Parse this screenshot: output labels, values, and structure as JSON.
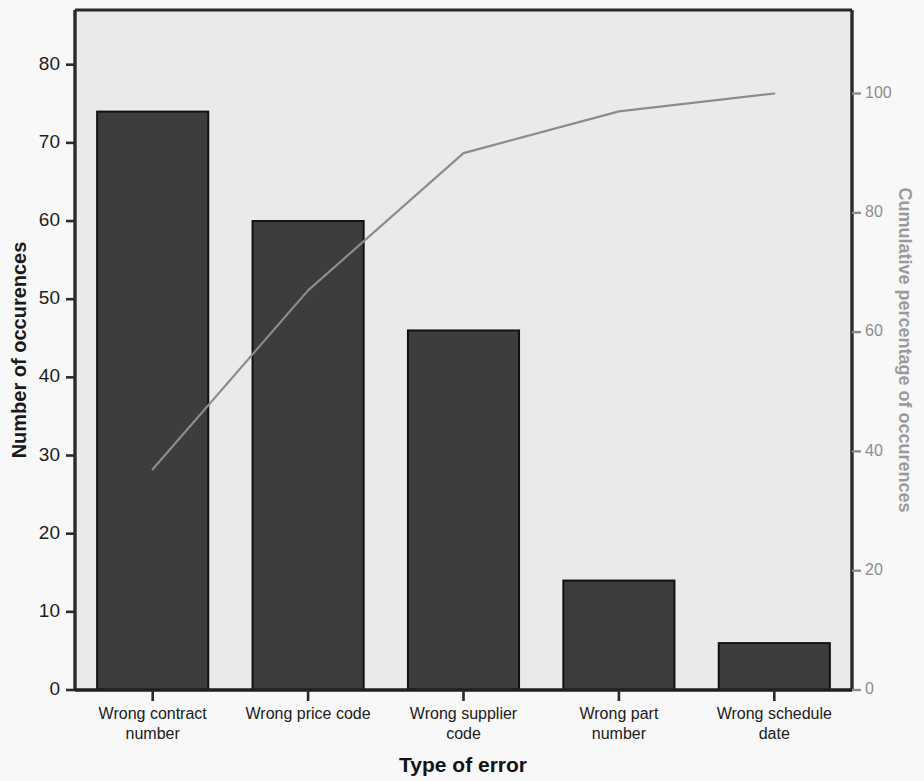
{
  "chart_data": {
    "type": "bar",
    "title": "",
    "subtitle": "",
    "xlabel": "Type of error",
    "ylabel": "Number of occurences",
    "y2label": "Cumulative percentage of occurences",
    "categories": [
      "Wrong contract number",
      "Wrong price code",
      "Wrong supplier code",
      "Wrong part number",
      "Wrong schedule date"
    ],
    "category_lines": [
      [
        "Wrong contract",
        "number"
      ],
      [
        "Wrong price code",
        ""
      ],
      [
        "Wrong supplier",
        "code"
      ],
      [
        "Wrong part",
        "number"
      ],
      [
        "Wrong schedule",
        "date"
      ]
    ],
    "values": [
      74,
      60,
      46,
      14,
      6
    ],
    "series": [
      {
        "name": "Number of occurences",
        "kind": "bar",
        "axis": "left",
        "values": [
          74,
          60,
          46,
          14,
          6
        ]
      },
      {
        "name": "Cumulative percentage of occurences",
        "kind": "line",
        "axis": "right",
        "values": [
          37,
          67,
          90,
          97,
          100
        ]
      }
    ],
    "ylim": [
      0,
      87
    ],
    "y2lim": [
      0,
      114
    ],
    "yticks": [
      0,
      10,
      20,
      30,
      40,
      50,
      60,
      70,
      80
    ],
    "ytick_labels": [
      "0",
      "10",
      "20",
      "30",
      "40",
      "50",
      "60",
      "70",
      "80"
    ],
    "y2ticks": [
      0,
      20,
      40,
      60,
      80,
      100
    ],
    "y2tick_labels": [
      "0",
      "20",
      "40",
      "60",
      "80",
      "100"
    ],
    "grid": false,
    "legend": "none",
    "total_occurences": 200,
    "colors": {
      "bar_fill": "#3d3d3d",
      "bar_edge": "#111111",
      "line": "#8c8c8c",
      "plot_background": "#eaeaea",
      "page_background": "#f8f8f8",
      "axis": "#2a2a2a",
      "right_axis_text": "#8d8d8d"
    }
  }
}
